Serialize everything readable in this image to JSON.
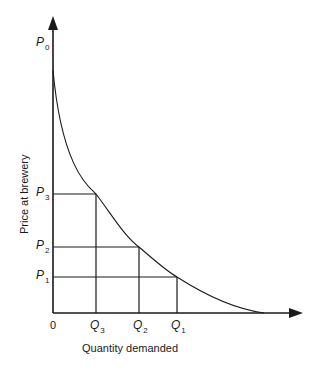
{
  "diagram": {
    "type": "demand-curve",
    "y_axis": {
      "label": "Price at brewery",
      "top_label": {
        "main": "P",
        "sub": "0"
      }
    },
    "x_axis": {
      "label": "Quantity demanded",
      "origin_label": "0"
    },
    "price_levels": [
      {
        "main": "P",
        "sub": "3"
      },
      {
        "main": "P",
        "sub": "2"
      },
      {
        "main": "P",
        "sub": "1"
      }
    ],
    "quantity_levels": [
      {
        "main": "Q",
        "sub": "3"
      },
      {
        "main": "Q",
        "sub": "2"
      },
      {
        "main": "Q",
        "sub": "1"
      }
    ],
    "colors": {
      "line": "#1a1a1a",
      "background": "#ffffff"
    }
  }
}
